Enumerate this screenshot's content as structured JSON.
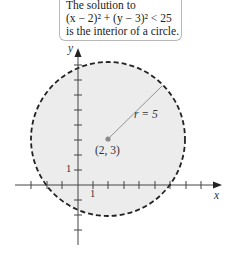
{
  "caption": {
    "line1": "The solution to",
    "line2": "(x − 2)² + (y − 3)² < 25",
    "line3": "is the interior of a circle."
  },
  "labels": {
    "radius": "r = 5",
    "center": "(2, 3)",
    "x_axis": "x",
    "y_axis": "y",
    "x_unit": "1",
    "y_unit": "1"
  },
  "geometry": {
    "center": [
      2,
      3
    ],
    "radius": 5,
    "inequality": "(x - 2)^2 + (y - 3)^2 < 25",
    "boundary_style": "dashed",
    "fill": "#ececec"
  }
}
